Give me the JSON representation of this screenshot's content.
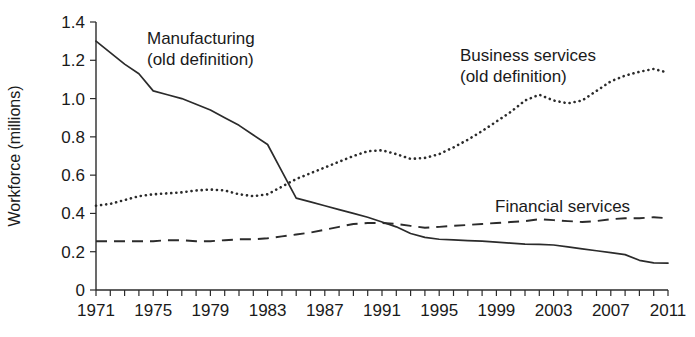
{
  "chart_data": {
    "type": "line",
    "title": "",
    "xlabel": "",
    "ylabel": "Workforce (millions)",
    "ylim": [
      0,
      1.4
    ],
    "xlim": [
      1971,
      2011
    ],
    "grid": false,
    "legend_position": "inline-annotations",
    "y_ticks": [
      "0",
      "0.2",
      "0.4",
      "0.6",
      "0.8",
      "1.0",
      "1.2",
      "1.4"
    ],
    "y_tick_values": [
      0,
      0.2,
      0.4,
      0.6,
      0.8,
      1.0,
      1.2,
      1.4
    ],
    "x_ticks": [
      "1971",
      "1975",
      "1979",
      "1983",
      "1987",
      "1991",
      "1995",
      "1999",
      "2003",
      "2007",
      "2011"
    ],
    "x_tick_values": [
      1971,
      1975,
      1979,
      1983,
      1987,
      1991,
      1995,
      1999,
      2003,
      2007,
      2011
    ],
    "x_minor_tick_step": 1,
    "x": [
      1971,
      1972,
      1973,
      1974,
      1975,
      1976,
      1977,
      1978,
      1979,
      1980,
      1981,
      1982,
      1983,
      1984,
      1985,
      1986,
      1987,
      1988,
      1989,
      1990,
      1991,
      1992,
      1993,
      1994,
      1995,
      1996,
      1997,
      1998,
      1999,
      2000,
      2001,
      2002,
      2003,
      2004,
      2005,
      2006,
      2007,
      2008,
      2009,
      2010,
      2011
    ],
    "series": [
      {
        "name": "Manufacturing (old definition)",
        "style": "solid",
        "color": "#2b2b2b",
        "label_line1": "Manufacturing",
        "label_line2": "(old definition)",
        "values": [
          1.3,
          1.24,
          1.18,
          1.13,
          1.04,
          1.02,
          1.0,
          0.97,
          0.94,
          0.9,
          0.86,
          0.81,
          0.76,
          0.62,
          0.48,
          0.46,
          0.44,
          0.42,
          0.4,
          0.38,
          0.355,
          0.33,
          0.295,
          0.275,
          0.265,
          0.262,
          0.258,
          0.255,
          0.25,
          0.245,
          0.24,
          0.238,
          0.235,
          0.225,
          0.215,
          0.205,
          0.195,
          0.185,
          0.155,
          0.142,
          0.14
        ]
      },
      {
        "name": "Business services (old definition)",
        "style": "dotted",
        "color": "#2b2b2b",
        "label_line1": "Business services",
        "label_line2": "(old definition)",
        "values": [
          0.44,
          0.45,
          0.47,
          0.49,
          0.5,
          0.505,
          0.51,
          0.52,
          0.525,
          0.52,
          0.5,
          0.49,
          0.5,
          0.54,
          0.58,
          0.61,
          0.64,
          0.67,
          0.7,
          0.725,
          0.73,
          0.71,
          0.685,
          0.69,
          0.71,
          0.745,
          0.785,
          0.83,
          0.88,
          0.93,
          0.99,
          1.02,
          0.99,
          0.975,
          0.99,
          1.04,
          1.09,
          1.12,
          1.14,
          1.155,
          1.135
        ]
      },
      {
        "name": "Financial services",
        "style": "dashed",
        "color": "#2b2b2b",
        "label_line1": "Financial services",
        "label_line2": "",
        "values": [
          0.255,
          0.255,
          0.255,
          0.255,
          0.255,
          0.26,
          0.26,
          0.255,
          0.255,
          0.26,
          0.265,
          0.265,
          0.27,
          0.28,
          0.29,
          0.3,
          0.315,
          0.33,
          0.345,
          0.35,
          0.35,
          0.345,
          0.335,
          0.325,
          0.33,
          0.335,
          0.34,
          0.345,
          0.35,
          0.355,
          0.36,
          0.37,
          0.365,
          0.36,
          0.355,
          0.36,
          0.37,
          0.375,
          0.375,
          0.38,
          0.375
        ]
      }
    ],
    "annotations": [
      {
        "name": "manufacturing-label",
        "text_line1": "Manufacturing",
        "text_line2": "(old definition)"
      },
      {
        "name": "business-services-label",
        "text_line1": "Business services",
        "text_line2": "(old definition)"
      },
      {
        "name": "financial-services-label",
        "text_line1": "Financial services",
        "text_line2": ""
      }
    ]
  }
}
